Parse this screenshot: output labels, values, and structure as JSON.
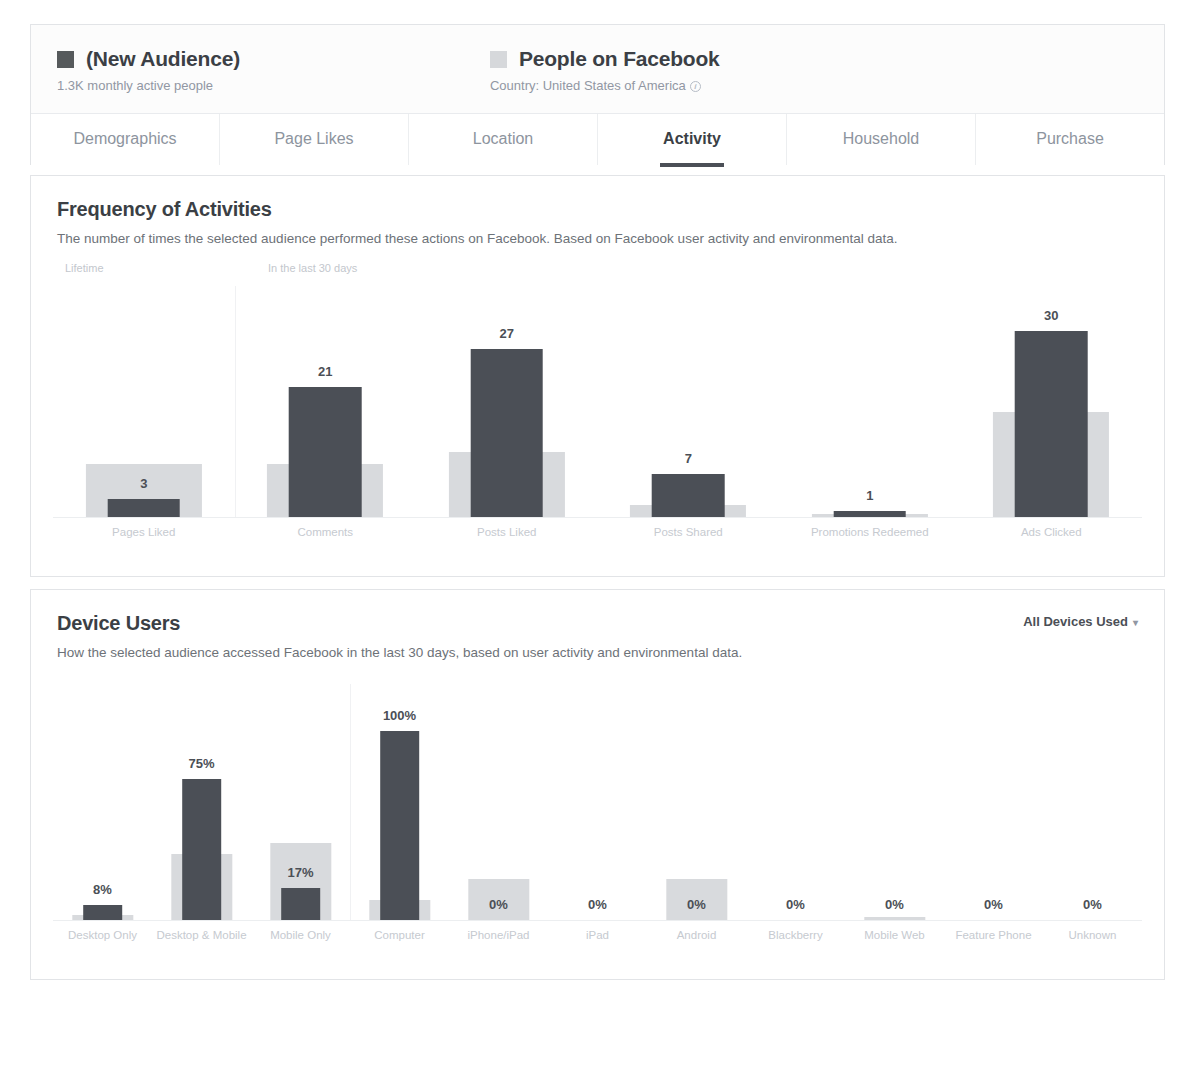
{
  "header": {
    "audience": {
      "swatch_color": "#565a5c",
      "title": "(New Audience)",
      "subtitle": "1.3K monthly active people"
    },
    "comparison": {
      "swatch_color": "#d6d8db",
      "title": "People on Facebook",
      "subtitle": "Country: United States of America",
      "info_glyph": "i"
    }
  },
  "tabs": [
    {
      "label": "Demographics",
      "active": false
    },
    {
      "label": "Page Likes",
      "active": false
    },
    {
      "label": "Location",
      "active": false
    },
    {
      "label": "Activity",
      "active": true
    },
    {
      "label": "Household",
      "active": false
    },
    {
      "label": "Purchase",
      "active": false
    }
  ],
  "frequency_section": {
    "title": "Frequency of Activities",
    "description": "The number of times the selected audience performed these actions on Facebook. Based on Facebook user activity and environmental data.",
    "legend_left": "Lifetime",
    "legend_right": "In the last 30 days"
  },
  "device_section": {
    "title": "Device Users",
    "description": "How the selected audience accessed Facebook in the last 30 days, based on user activity and environmental data.",
    "filter_label": "All Devices Used",
    "caret_glyph": "▾"
  },
  "chart_data": [
    {
      "type": "bar",
      "title": "Frequency of Activities",
      "xlabel": "",
      "ylabel": "",
      "grid": false,
      "legend_position": "top-left",
      "categories": [
        "Pages Liked",
        "Comments",
        "Posts Liked",
        "Posts Shared",
        "Promotions Redeemed",
        "Ads Clicked"
      ],
      "group_labels": [
        "Lifetime",
        "In the last 30 days"
      ],
      "group_split_after_index": 0,
      "series": [
        {
          "name": "(New Audience)",
          "color": "#4b4f56",
          "values": [
            3,
            21,
            27,
            7,
            1,
            30
          ],
          "value_labels": [
            "3",
            "21",
            "27",
            "7",
            "1",
            "30"
          ]
        },
        {
          "name": "People on Facebook",
          "color": "#d8dadd",
          "values": [
            8.5,
            8.5,
            10.5,
            2.0,
            0.6,
            17.0
          ],
          "value_labels": [
            "",
            "",
            "",
            "",
            "",
            ""
          ]
        }
      ],
      "ylim": [
        0,
        32
      ]
    },
    {
      "type": "bar",
      "title": "Device Users",
      "xlabel": "",
      "ylabel": "",
      "grid": false,
      "legend_position": "none",
      "unit": "%",
      "categories": [
        "Desktop Only",
        "Desktop & Mobile",
        "Mobile Only",
        "Computer",
        "iPhone/iPad",
        "iPad",
        "Android",
        "Blackberry",
        "Mobile Web",
        "Feature Phone",
        "Unknown"
      ],
      "group_split_after_index": 2,
      "series": [
        {
          "name": "(New Audience)",
          "color": "#4b4f56",
          "values": [
            8,
            75,
            17,
            100,
            0,
            0,
            0,
            0,
            0,
            0,
            0
          ],
          "value_labels": [
            "8%",
            "75%",
            "17%",
            "100%",
            "0%",
            "0%",
            "0%",
            "0%",
            "0%",
            "0%",
            "0%"
          ]
        },
        {
          "name": "People on Facebook",
          "color": "#d8dadd",
          "values": [
            3,
            35,
            41,
            11,
            22,
            0,
            22,
            0,
            2,
            0,
            0
          ],
          "value_labels": [
            "",
            "",
            "",
            "",
            "",
            "",
            "",
            "",
            "",
            "",
            ""
          ]
        }
      ],
      "ylim": [
        0,
        100
      ]
    }
  ]
}
